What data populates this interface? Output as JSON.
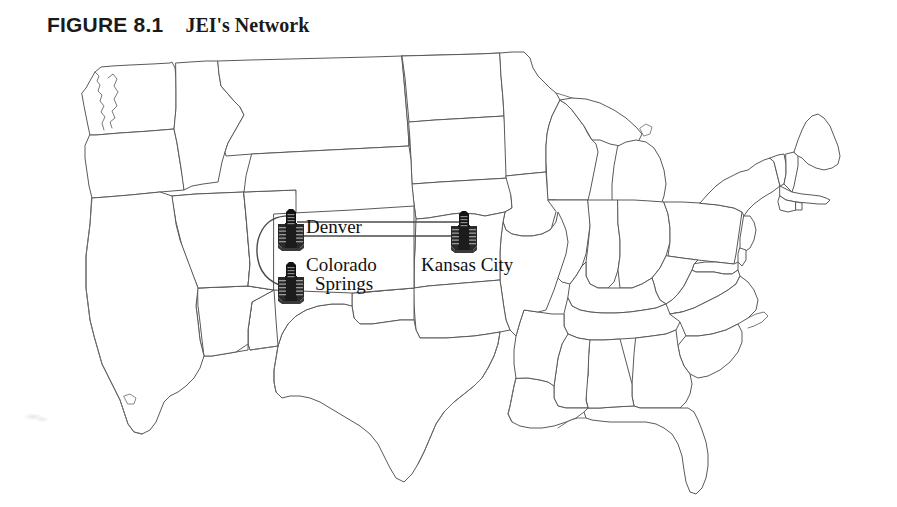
{
  "figure": {
    "label": "FIGURE 8.1",
    "title": "JEI's Network"
  },
  "map": {
    "region": "United States",
    "outline_color": "#5a5a5a",
    "fill_color": "#ffffff",
    "background_color": "#ffffff"
  },
  "network": {
    "node_icon": "server-building-icon",
    "node_color": "#1b1b1b",
    "link_color": "#4a4a4a",
    "nodes": [
      {
        "id": "denver",
        "label": "Denver",
        "label_lines": [
          "Denver"
        ],
        "x": 291,
        "y": 230
      },
      {
        "id": "colorado_springs",
        "label": "Colorado Springs",
        "label_lines": [
          "Colorado",
          "Springs"
        ],
        "x": 291,
        "y": 283
      },
      {
        "id": "kansas_city",
        "label": "Kansas City",
        "label_lines": [
          "Kansas City"
        ],
        "x": 464,
        "y": 232
      }
    ],
    "links": [
      {
        "from": "denver",
        "to": "kansas_city",
        "style": "double-straight"
      },
      {
        "from": "denver",
        "to": "colorado_springs",
        "style": "arc-left"
      }
    ]
  }
}
